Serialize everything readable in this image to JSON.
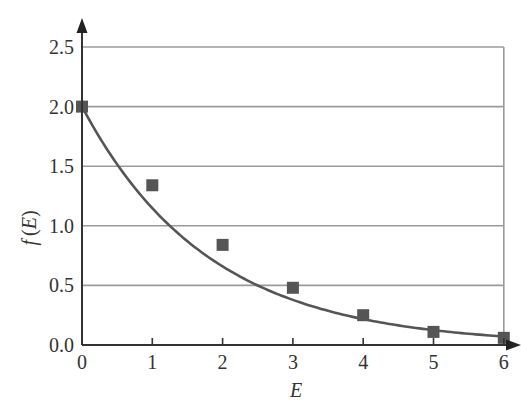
{
  "chart_data": {
    "type": "scatter",
    "title": "",
    "xlabel": "E",
    "ylabel": "f (E)",
    "xlim": [
      0,
      6
    ],
    "ylim": [
      0,
      2.5
    ],
    "x_ticks": [
      "0",
      "1",
      "2",
      "3",
      "4",
      "5",
      "6"
    ],
    "y_ticks": [
      "0.0",
      "0.5",
      "1.0",
      "1.5",
      "2.0",
      "2.5"
    ],
    "grid": "horizontal",
    "legend": "none",
    "series": [
      {
        "name": "data points",
        "kind": "scatter",
        "marker": "square",
        "color": "#555555",
        "x": [
          0,
          1,
          2,
          3,
          4,
          5,
          6
        ],
        "y": [
          2.0,
          1.34,
          0.84,
          0.48,
          0.25,
          0.11,
          0.06
        ]
      },
      {
        "name": "fit curve",
        "kind": "line",
        "color": "#555555",
        "equation": "f(E) = 2.0 e^(-0.55 E)",
        "x": [
          0,
          1,
          2,
          3,
          4,
          5,
          6
        ],
        "y": [
          2.0,
          1.15,
          0.67,
          0.38,
          0.22,
          0.13,
          0.07
        ]
      }
    ]
  },
  "axes": {
    "x_title": "E",
    "y_title_f": "f",
    "y_title_E": "(E)"
  },
  "colors": {
    "axis": "#333333",
    "grid": "#9a9a9a",
    "marker": "#555555",
    "curve": "#555555"
  }
}
